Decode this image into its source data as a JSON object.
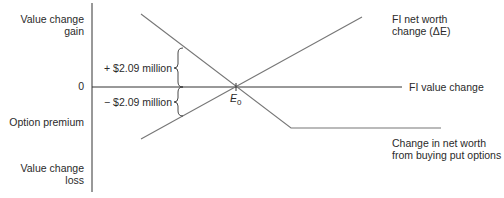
{
  "diagram": {
    "y_axis": {
      "top_label": [
        "Value change",
        "gain"
      ],
      "zero_label": "0",
      "option_premium_label": "Option premium",
      "bottom_label": [
        "Value change",
        "loss"
      ]
    },
    "x_axis": {
      "label": "FI value change"
    },
    "annotations": {
      "gain_brace": "+ $2.09 million",
      "loss_brace": "− $2.09 million",
      "equilibrium_point": "E",
      "equilibrium_subscript": "0"
    },
    "lines": {
      "fi_net_worth": [
        "FI net worth",
        "change (ΔE)"
      ],
      "put_options": [
        "Change in net worth",
        "from buying put options"
      ]
    },
    "colors": {
      "axis": "#333333",
      "line": "#777777",
      "text": "#2a2a2a"
    }
  }
}
